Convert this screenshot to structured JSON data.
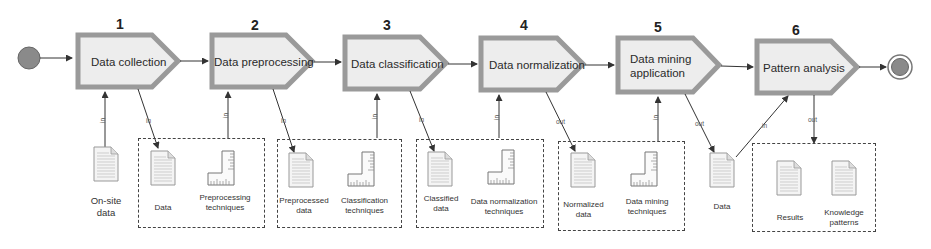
{
  "diagram": {
    "colors": {
      "step_border": "#9a9a9a",
      "step_fill": "#ededed",
      "start_event": "#8a8a8a",
      "line": "#333333",
      "dashed_box": "#444444"
    },
    "start_event": {
      "icon": "start-circle-icon"
    },
    "end_event": {
      "icon": "end-double-circle-icon"
    },
    "steps": [
      {
        "number": "1",
        "label": "Data collection"
      },
      {
        "number": "2",
        "label": "Data preprocessing"
      },
      {
        "number": "3",
        "label": "Data classification"
      },
      {
        "number": "4",
        "label": "Data normalization"
      },
      {
        "number": "5",
        "label_line1": "Data mining",
        "label_line2": "application"
      },
      {
        "number": "6",
        "label": "Pattern analysis"
      }
    ],
    "arrow_labels": {
      "in": "in",
      "out": "out"
    },
    "artifacts": {
      "onsite_data": {
        "line1": "On-site",
        "line2": "data",
        "icon": "document-icon"
      },
      "group1": {
        "doc": "Data",
        "tool_line1": "Preprocessing",
        "tool_line2": "techniques"
      },
      "group2": {
        "doc_line1": "Preprocessed",
        "doc_line2": "data",
        "tool_line1": "Classification",
        "tool_line2": "techniques"
      },
      "group3": {
        "doc_line1": "Classified",
        "doc_line2": "data",
        "tool_line1": "Data normalization",
        "tool_line2": "techniques"
      },
      "group4": {
        "doc_line1": "Normalized",
        "doc_line2": "data",
        "tool_line1": "Data mining",
        "tool_line2": "techniques"
      },
      "mined_data": {
        "label": "Data"
      },
      "group5": {
        "doc1": "Results",
        "doc2_line1": "Knowledge",
        "doc2_line2": "patterns"
      }
    }
  }
}
